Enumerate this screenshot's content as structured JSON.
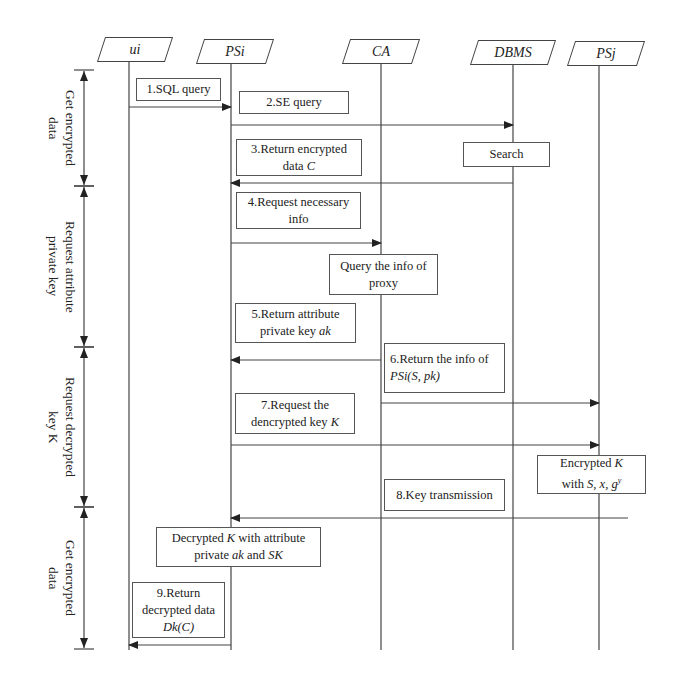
{
  "actors": [
    {
      "id": "ui",
      "label": "ui",
      "x": 129,
      "box_left": 101,
      "box_width": 68
    },
    {
      "id": "psi",
      "label": "PSi",
      "x": 231,
      "box_left": 200,
      "box_width": 70
    },
    {
      "id": "ca",
      "label": "CA",
      "x": 381,
      "box_left": 346,
      "box_width": 70
    },
    {
      "id": "dbms",
      "label": "DBMS",
      "x": 513,
      "box_left": 474,
      "box_width": 78
    },
    {
      "id": "psj",
      "label": "PSj",
      "x": 599,
      "box_left": 571,
      "box_width": 70
    }
  ],
  "phases": [
    {
      "label": "Get encrypted\ndata",
      "y1": 70,
      "y2": 186
    },
    {
      "label": "Request attribute\nprivate key",
      "y1": 186,
      "y2": 347
    },
    {
      "label": "Request decrypted\nkey K",
      "y1": 347,
      "y2": 507
    },
    {
      "label": "Get encrypted\ndata",
      "y1": 507,
      "y2": 649
    }
  ],
  "messages": [
    {
      "step": "1",
      "label": "1.SQL query",
      "from_x": 129,
      "to_x": 231,
      "y": 107,
      "dir": "right"
    },
    {
      "step": "2",
      "label": "2.SE query",
      "from_x": 231,
      "to_x": 513,
      "y": 125,
      "dir": "right"
    },
    {
      "step": "3",
      "label": "3.Return encrypted data C",
      "from_x": 513,
      "to_x": 231,
      "y": 183,
      "dir": "left"
    },
    {
      "step": "4",
      "label": "4.Request necessary info",
      "from_x": 231,
      "to_x": 381,
      "y": 243,
      "dir": "right"
    },
    {
      "step": "5",
      "label": "5.Return attribute private key ak",
      "from_x": 381,
      "to_x": 231,
      "y": 360,
      "dir": "left"
    },
    {
      "step": "6",
      "label": "6.Return the info of PSi(S, pk)",
      "from_x": 381,
      "to_x": 599,
      "y": 403,
      "dir": "right"
    },
    {
      "step": "7",
      "label": "7.Request the dencrypted key K",
      "from_x": 231,
      "to_x": 599,
      "y": 445,
      "dir": "right"
    },
    {
      "step": "8",
      "label": "8.Key transmission",
      "from_x": 628,
      "to_x": 231,
      "y": 518,
      "dir": "left"
    },
    {
      "step": "9",
      "label": "9.Return decrypted data Dk(C)",
      "from_x": 231,
      "to_x": 129,
      "y": 645,
      "dir": "left"
    }
  ],
  "notes": {
    "n1": {
      "line1": "1.SQL query"
    },
    "n2": {
      "line1": "2.SE query"
    },
    "n3": {
      "line1": "3.Return encrypted",
      "line2_text": "data ",
      "line2_var": "C"
    },
    "search": {
      "line1": "Search"
    },
    "n4": {
      "line1": "4.Request necessary",
      "line2": "info"
    },
    "query": {
      "line1": "Query the info of",
      "line2": "proxy"
    },
    "n5": {
      "line1": "5.Return attribute",
      "line2_text": "private key ",
      "line2_var": "ak"
    },
    "n6": {
      "line1": "6.Return the info of",
      "line2_var": "PSi(S, pk)"
    },
    "n7": {
      "line1": "7.Request the",
      "line2_text": "dencrypted key ",
      "line2_var": "K"
    },
    "encK": {
      "l1_text": "Encrypted ",
      "l1_var": "K",
      "l2_text": "with ",
      "l2_var": "S, x, g",
      "l2_sup": "y"
    },
    "n8": {
      "line1": "8.Key transmission"
    },
    "dec": {
      "l1_text": "Decrypted ",
      "l1_var": "K",
      "l1_rest": " with attribute",
      "l2_text": "private ",
      "l2_var": "ak",
      "l2_mid": " and ",
      "l2_var2": "SK"
    },
    "n9": {
      "line1": "9.Return",
      "line2": "decrypted data",
      "line3_var": "Dk(C)"
    }
  },
  "colors": {
    "line": "#444444",
    "background": "#ffffff",
    "text": "#222222"
  },
  "lifeline_top": 62,
  "lifeline_bottom": 650
}
